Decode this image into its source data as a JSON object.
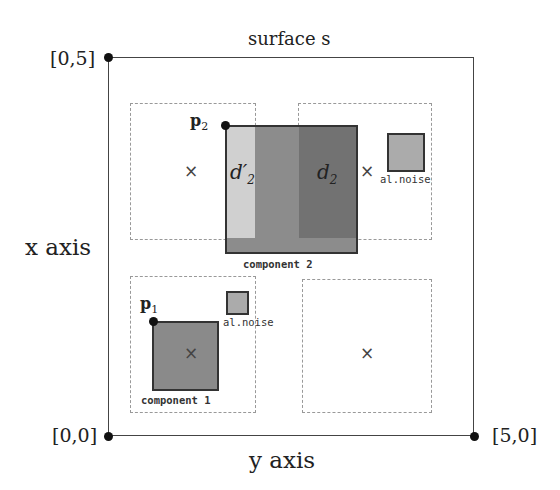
{
  "title": "surface s",
  "axes": {
    "x_label": "x axis",
    "y_label": "y axis"
  },
  "corners": {
    "top_left": "[0,5]",
    "bottom_left": "[0,0]",
    "bottom_right": "[5,0]"
  },
  "points": {
    "p1": "p",
    "p1_sub": "1",
    "p2": "p",
    "p2_sub": "2"
  },
  "component1": {
    "label": "component 1",
    "noise_label": "al.noise"
  },
  "component2": {
    "label": "component 2",
    "noise_label": "al.noise",
    "region_a": "d",
    "region_a_sub": "2",
    "region_a_prime": "′",
    "region_b": "d",
    "region_b_sub": "2"
  },
  "markers": {
    "cross": "×"
  },
  "colors": {
    "light": "#cfcfcf",
    "mid": "#8a8a8a",
    "dark": "#6e6e6e",
    "noise": "#aaaaaa",
    "comp1": "#888888"
  }
}
